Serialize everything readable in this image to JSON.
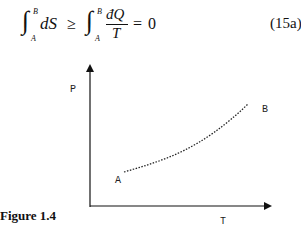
{
  "equation": {
    "lhs_lower": "A",
    "lhs_upper": "B",
    "lhs_integrand": "dS",
    "relation": "≥",
    "rhs_lower": "A",
    "rhs_upper": "B",
    "rhs_numerator": "đQ",
    "rhs_denominator": "T",
    "equals": "=",
    "result": "0",
    "number": "(15a)"
  },
  "figure": {
    "caption": "Figure 1.4",
    "y_axis_label": "P",
    "x_axis_label": "T",
    "start_label": "A",
    "end_label": "B"
  }
}
